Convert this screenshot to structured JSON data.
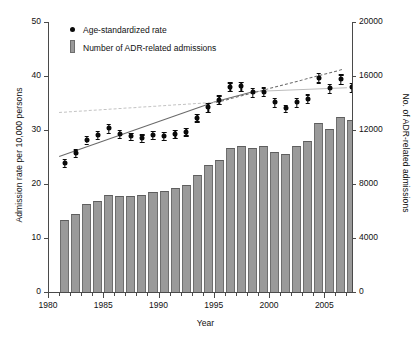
{
  "chart_data": {
    "type": "bar",
    "title": "",
    "xlabel": "Year",
    "ylabel": "Admission rate per 10,000 persons",
    "ylabel_right": "No. of ADR-related admissions",
    "xlim": [
      1980,
      2007.5
    ],
    "ylim": [
      0,
      50
    ],
    "ylim_right": [
      0,
      20000
    ],
    "yticks": [
      0,
      10,
      20,
      30,
      40,
      50
    ],
    "yticks_right": [
      0,
      4000,
      8000,
      12000,
      16000,
      20000
    ],
    "xticks": [
      1980,
      1985,
      1990,
      1995,
      2000,
      2005
    ],
    "xticks_minor_step": 1,
    "grid": false,
    "legend_position": "top-left",
    "legend": [
      {
        "label": "Age-standardized rate",
        "marker": "circle",
        "color": "#0a0a0a"
      },
      {
        "label": "Number of ADR-related admissions",
        "marker": "bar",
        "color": "#9a9a9a"
      }
    ],
    "series": [
      {
        "name": "Number of ADR-related admissions",
        "type": "bar",
        "axis": "right",
        "color": "#9a9a9a",
        "x": [
          1981,
          1982,
          1983,
          1984,
          1985,
          1986,
          1987,
          1988,
          1989,
          1990,
          1991,
          1992,
          1993,
          1994,
          1995,
          1996,
          1997,
          1998,
          1999,
          2000,
          2001,
          2002,
          2003,
          2004,
          2005,
          2006,
          2007
        ],
        "values": [
          5300,
          5750,
          6500,
          6750,
          7200,
          7100,
          7100,
          7150,
          7400,
          7450,
          7700,
          7900,
          8650,
          9400,
          9800,
          10650,
          10850,
          10650,
          10800,
          10400,
          10250,
          10800,
          11150,
          12500,
          12100,
          12950,
          12750
        ]
      },
      {
        "name": "Age-standardized rate",
        "type": "scatter",
        "axis": "left",
        "color": "#0a0a0a",
        "x": [
          1981,
          1982,
          1983,
          1984,
          1985,
          1986,
          1987,
          1988,
          1989,
          1990,
          1991,
          1992,
          1993,
          1994,
          1995,
          1996,
          1997,
          1998,
          1999,
          2000,
          2001,
          2002,
          2003,
          2004,
          2005,
          2006,
          2007
        ],
        "values": [
          23.9,
          25.7,
          28.2,
          29.1,
          30.3,
          29.3,
          28.8,
          28.5,
          29.1,
          28.9,
          29.3,
          29.7,
          32.3,
          34.2,
          35.6,
          38.0,
          38.1,
          37.0,
          37.1,
          35.1,
          34.0,
          35.1,
          35.8,
          39.7,
          37.7,
          39.4,
          37.9
        ],
        "error_low": [
          23.2,
          25.0,
          27.5,
          28.4,
          29.5,
          28.6,
          28.1,
          27.8,
          28.4,
          28.2,
          28.6,
          29.0,
          31.6,
          33.4,
          34.8,
          37.2,
          37.3,
          36.2,
          36.3,
          34.3,
          33.3,
          34.3,
          35.0,
          38.8,
          36.9,
          38.5,
          37.1
        ],
        "error_high": [
          24.6,
          26.4,
          28.9,
          29.8,
          31.1,
          30.0,
          29.5,
          29.2,
          29.8,
          29.6,
          30.0,
          30.4,
          33.0,
          35.0,
          36.4,
          38.8,
          38.9,
          37.8,
          37.9,
          35.9,
          34.7,
          35.9,
          36.6,
          40.6,
          38.5,
          40.3,
          38.7
        ]
      }
    ],
    "trendlines": [
      {
        "name": "joinpoint-segment-1",
        "style": "solid",
        "color": "#6a6a6a",
        "x": [
          1981,
          1995.2
        ],
        "y": [
          25.2,
          35.4
        ]
      },
      {
        "name": "joinpoint-segment-2",
        "style": "solid",
        "color": "#6a6a6a",
        "x": [
          1995.2,
          1998.5
        ],
        "y": [
          35.4,
          37.2
        ]
      },
      {
        "name": "joinpoint-segment-3",
        "style": "solid",
        "color": "#bdbdbd",
        "x": [
          1998.5,
          2007
        ],
        "y": [
          37.2,
          37.9
        ]
      },
      {
        "name": "reference-trend-dashed-early",
        "style": "dashed",
        "color": "#c3c3c3",
        "x": [
          1981,
          1995.2
        ],
        "y": [
          33.3,
          35.2
        ]
      },
      {
        "name": "reference-trend-dashed-late",
        "style": "dashed",
        "color": "#6a6a6a",
        "x": [
          1995.2,
          2006.6
        ],
        "y": [
          35.2,
          41.3
        ]
      }
    ]
  },
  "axes": {
    "y_left": {
      "title": "Admission rate per 10,000 persons",
      "labels": [
        "50",
        "40",
        "30",
        "20",
        "10",
        "0"
      ]
    },
    "y_right": {
      "title": "No. of ADR-related admissions",
      "labels": [
        "20000",
        "16000",
        "12000",
        "8000",
        "4000",
        "0"
      ]
    },
    "x": {
      "title": "Year",
      "labels": [
        "1980",
        "1985",
        "1990",
        "1995",
        "2000",
        "2005"
      ]
    }
  },
  "legend": {
    "items": [
      {
        "label": "Age-standardized rate"
      },
      {
        "label": "Number of ADR-related admissions"
      }
    ]
  }
}
